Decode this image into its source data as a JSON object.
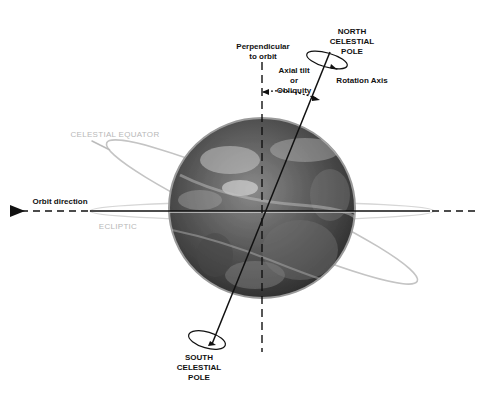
{
  "diagram": {
    "labels": {
      "north_pole": [
        "NORTH",
        "CELESTIAL",
        "POLE"
      ],
      "south_pole": [
        "SOUTH",
        "CELESTIAL",
        "POLE"
      ],
      "perpendicular": [
        "Perpendicular",
        "to orbit"
      ],
      "axial_tilt": [
        "Axial tilt",
        "or",
        "Obliquity"
      ],
      "rotation_axis": "Rotation Axis",
      "celestial_equator": "CELESTIAL EQUATOR",
      "orbit_direction": "Orbit direction",
      "ecliptic": "ECLIPTIC"
    },
    "colors": {
      "ink": "#111111",
      "faint_label": "#b8b8b8",
      "ring": "#c8c8c8",
      "globe_dark": "#3a3a3a",
      "globe_light": "#bdbdbd",
      "background": "#ffffff"
    }
  }
}
